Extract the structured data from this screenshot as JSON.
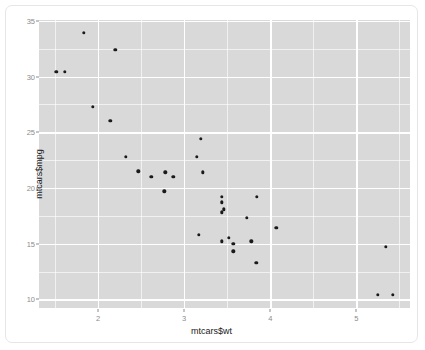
{
  "chart_data": {
    "type": "scatter",
    "title": "",
    "xlabel": "mtcars$wt",
    "ylabel": "mtcars$mpg",
    "xlim": [
      1.3125,
      5.6245
    ],
    "ylim": [
      9.225,
      35.075
    ],
    "xticks": [
      2,
      3,
      4,
      5
    ],
    "yticks": [
      10,
      15,
      20,
      25,
      30,
      35
    ],
    "xticklabels": [
      "2",
      "3",
      "4",
      "5"
    ],
    "yticklabels": [
      "10",
      "15",
      "20",
      "25",
      "30",
      "35"
    ],
    "xminor": [
      1.5,
      2.5,
      3.5,
      4.5,
      5.5
    ],
    "yminor": [
      12.5,
      17.5,
      22.5,
      27.5,
      32.5
    ],
    "grid": true,
    "legend": "none",
    "panel_background": "#d9d9d9",
    "gridline_color": "#ffffff",
    "point_color": "#1a1a1a",
    "axis_text_color": "#8c8c8c",
    "axis_title_color": "#1a1a1a",
    "x": [
      2.62,
      2.875,
      2.32,
      3.215,
      3.44,
      3.46,
      3.57,
      3.19,
      3.15,
      3.44,
      3.44,
      4.07,
      3.73,
      3.78,
      5.25,
      5.424,
      5.345,
      2.2,
      1.615,
      1.835,
      2.465,
      3.52,
      3.435,
      3.84,
      3.845,
      1.935,
      2.14,
      1.513,
      3.17,
      2.77,
      3.57,
      2.78
    ],
    "y": [
      21.0,
      21.0,
      22.8,
      21.4,
      18.7,
      18.1,
      14.3,
      24.4,
      22.8,
      19.2,
      17.8,
      16.4,
      17.3,
      15.2,
      10.4,
      10.4,
      14.7,
      32.4,
      30.4,
      33.9,
      21.5,
      15.5,
      15.2,
      13.3,
      19.2,
      27.3,
      26.0,
      30.4,
      15.8,
      19.7,
      15.0,
      21.4
    ],
    "n_points": 32
  },
  "axes": {
    "x_title": "mtcars$wt",
    "y_title": "mtcars$mpg"
  }
}
